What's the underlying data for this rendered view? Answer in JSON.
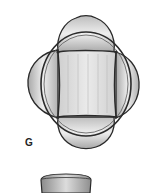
{
  "figure": {
    "panel_label": "G",
    "lower_object": "partial cup-shaped structure (cut off at bottom)"
  },
  "colors": {
    "outline": "#2a2a2a",
    "fill_light": "#e6e6e6",
    "fill_mid": "#c8c8c8",
    "fill_dark": "#9a9a9a"
  }
}
